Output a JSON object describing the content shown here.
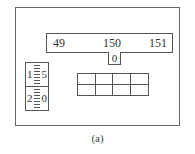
{
  "diagram": {
    "top_bar": {
      "left_value": "49",
      "center_value": "150",
      "right_value": "151"
    },
    "notch_value": "0",
    "spinner": {
      "top": {
        "left_digit": "1",
        "right_digit": "5"
      },
      "bottom": {
        "left_digit": "2",
        "right_digit": "0"
      }
    },
    "grid": {
      "rows": 2,
      "cols": 4
    },
    "caption": "(a)"
  }
}
